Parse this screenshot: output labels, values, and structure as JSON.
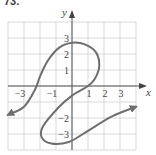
{
  "problem": {
    "label": "73."
  },
  "chart_data": {
    "type": "line",
    "title": "",
    "xlabel": "x",
    "ylabel": "y",
    "xlim": [
      -4,
      4
    ],
    "ylim": [
      -4,
      4
    ],
    "grid": true,
    "x_tick_labels": [
      "−3",
      "−1",
      "1",
      "2",
      "3"
    ],
    "x_tick_values": [
      -3,
      -1,
      1,
      2,
      3
    ],
    "y_tick_labels": [
      "3",
      "2",
      "1",
      "−2",
      "−3"
    ],
    "y_tick_values": [
      3,
      2,
      1,
      -2,
      -3
    ],
    "series": [
      {
        "name": "curve",
        "color": "#6e6e6e",
        "arrows": [
          "start",
          "end"
        ],
        "points": [
          [
            -4,
            -1.8
          ],
          [
            -3,
            -1.3
          ],
          [
            -2.3,
            -0.2
          ],
          [
            -2,
            0.6
          ],
          [
            -1.5,
            1.6
          ],
          [
            -0.8,
            2.4
          ],
          [
            0,
            2.7
          ],
          [
            0.8,
            2.6
          ],
          [
            1.5,
            2.1
          ],
          [
            1.7,
            1.2
          ],
          [
            1.4,
            0.4
          ],
          [
            1,
            0
          ],
          [
            0,
            -0.6
          ],
          [
            -0.8,
            -1.3
          ],
          [
            -1.8,
            -2.5
          ],
          [
            -1.9,
            -3.2
          ],
          [
            -1.3,
            -3.6
          ],
          [
            -0.2,
            -3.5
          ],
          [
            1,
            -2.8
          ],
          [
            2.5,
            -1.9
          ],
          [
            4,
            -1.3
          ]
        ]
      }
    ]
  }
}
